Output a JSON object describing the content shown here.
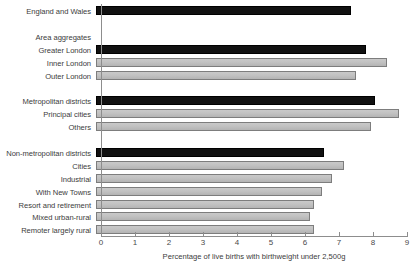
{
  "chart_data": {
    "type": "bar",
    "orientation": "horizontal",
    "title": "",
    "xlabel": "Percentage of live births with birthweight under 2,500g",
    "ylabel": "",
    "xlim": [
      0,
      9
    ],
    "xticks": [
      "0",
      "1",
      "2",
      "3",
      "4",
      "5",
      "6",
      "7",
      "8",
      "9"
    ],
    "grid": false,
    "legend": "none",
    "series_colors": {
      "total": "#111111",
      "subcategory": "#c2c2c2"
    },
    "rows": [
      {
        "label": "England and Wales",
        "value": 7.5,
        "style": "dark",
        "is_heading": false
      },
      {
        "label": "",
        "value": null,
        "style": "none",
        "is_heading": false
      },
      {
        "label": "Area aggregates",
        "value": null,
        "style": "none",
        "is_heading": true
      },
      {
        "label": "Greater London",
        "value": 7.95,
        "style": "dark",
        "is_heading": false
      },
      {
        "label": "Inner London",
        "value": 8.55,
        "style": "light",
        "is_heading": false
      },
      {
        "label": "Outer London",
        "value": 7.65,
        "style": "light",
        "is_heading": false
      },
      {
        "label": "",
        "value": null,
        "style": "none",
        "is_heading": false
      },
      {
        "label": "Metropolitan districts",
        "value": 8.2,
        "style": "dark",
        "is_heading": false
      },
      {
        "label": "Principal cities",
        "value": 8.9,
        "style": "light",
        "is_heading": false
      },
      {
        "label": "Others",
        "value": 8.1,
        "style": "light",
        "is_heading": false
      },
      {
        "label": "",
        "value": null,
        "style": "none",
        "is_heading": false
      },
      {
        "label": "Non-metropolitan districts",
        "value": 6.7,
        "style": "dark",
        "is_heading": false
      },
      {
        "label": "Cities",
        "value": 7.3,
        "style": "light",
        "is_heading": false
      },
      {
        "label": "Industrial",
        "value": 6.95,
        "style": "light",
        "is_heading": false
      },
      {
        "label": "With New Towns",
        "value": 6.65,
        "style": "light",
        "is_heading": false
      },
      {
        "label": "Resort and retirement",
        "value": 6.4,
        "style": "light",
        "is_heading": false
      },
      {
        "label": "Mixed urban-rural",
        "value": 6.3,
        "style": "light",
        "is_heading": false
      },
      {
        "label": "Remoter largely rural",
        "value": 6.4,
        "style": "light",
        "is_heading": false
      }
    ]
  }
}
